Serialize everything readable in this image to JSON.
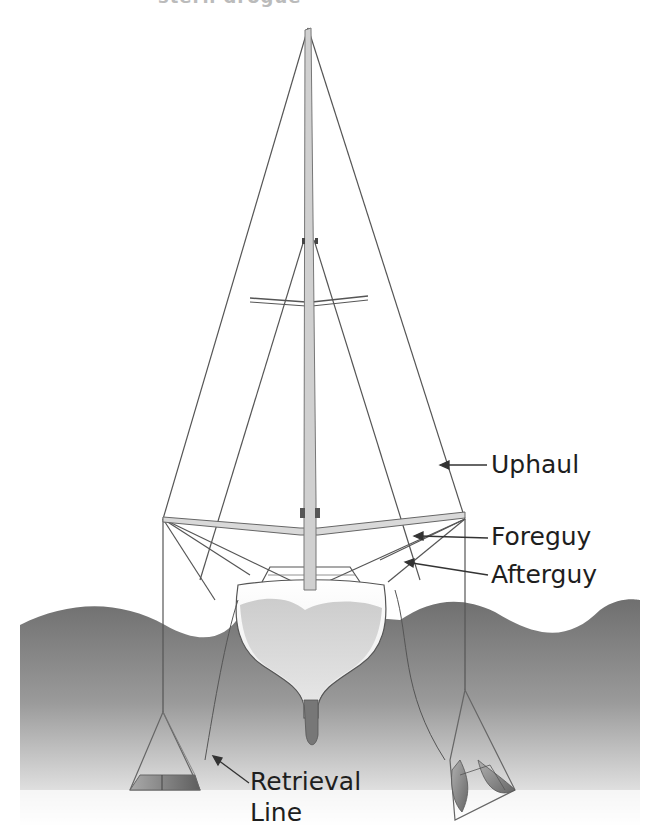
{
  "figure": {
    "title_cut": "stern drogue"
  },
  "labels": {
    "uphaul": "Uphaul",
    "foreguy": "Foreguy",
    "afterguy": "Afterguy",
    "retrieval_line_1": "Retrieval",
    "retrieval_line_2": "Line"
  },
  "colors": {
    "background": "#ffffff",
    "line": "#555555",
    "text": "#1e1e1e",
    "water_top": "#7a7a7a",
    "water_bottom": "#ffffff",
    "hull": "#f2f2f2",
    "mast": "#d0d0d0"
  }
}
